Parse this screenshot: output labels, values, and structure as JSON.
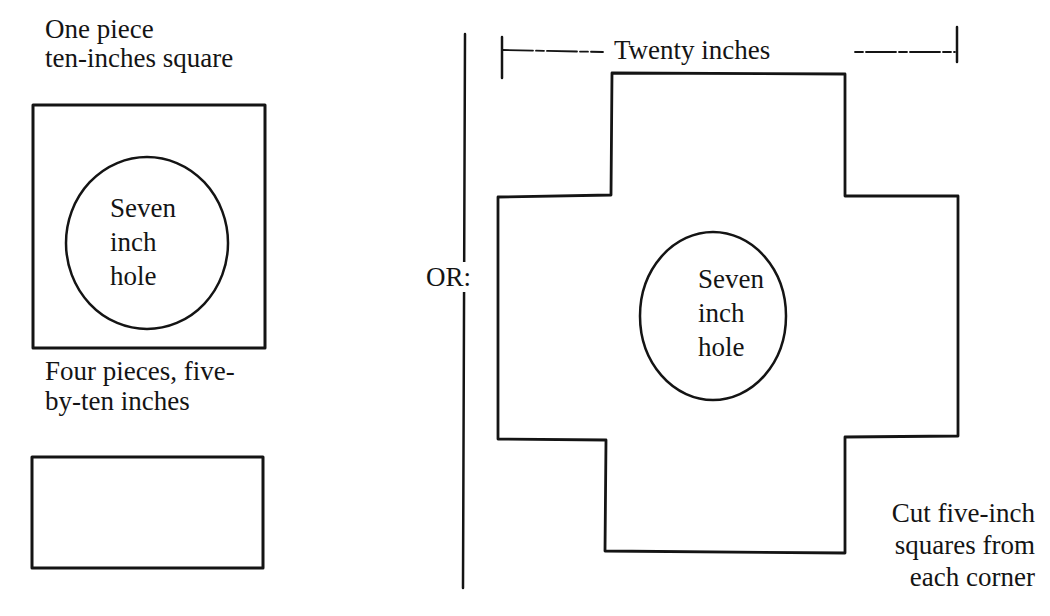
{
  "left_panel": {
    "top_caption": [
      "One piece",
      "ten-inches square"
    ],
    "square_hole_label": [
      "Seven",
      "inch",
      "hole"
    ],
    "middle_caption": [
      "Four pieces, five-",
      "by-ten inches"
    ]
  },
  "separator_label": "OR:",
  "right_panel": {
    "dimension_label": "Twenty inches",
    "cross_hole_label": [
      "Seven",
      "inch",
      "hole"
    ],
    "corner_note": [
      "Cut five-inch",
      "squares from",
      "each corner"
    ]
  },
  "colors": {
    "ink": "#141414",
    "background": "#ffffff"
  }
}
